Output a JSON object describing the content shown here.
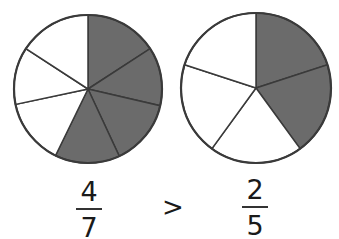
{
  "colors": {
    "shaded": "#6b6b6b",
    "unshaded": "#ffffff",
    "stroke": "#3a3a3a"
  },
  "pies": [
    {
      "name": "left-pie",
      "cx": 88,
      "cy": 89,
      "r": 74,
      "total": 7,
      "shaded": 4,
      "boundaries_deg": [
        0,
        57,
        103,
        155,
        206,
        258,
        303
      ]
    },
    {
      "name": "right-pie",
      "cx": 256,
      "cy": 88,
      "r": 75,
      "total": 5,
      "shaded": 2,
      "boundaries_deg": [
        0,
        72,
        144,
        216,
        288
      ]
    }
  ],
  "comparison": {
    "left": {
      "numerator": "4",
      "denominator": "7"
    },
    "operator": ">",
    "right": {
      "numerator": "2",
      "denominator": "5"
    }
  }
}
